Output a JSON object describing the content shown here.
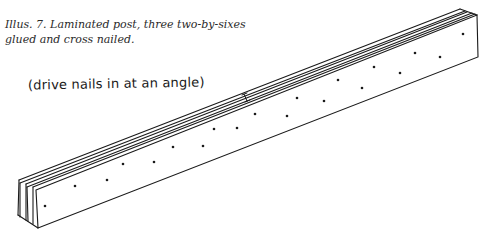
{
  "figure": {
    "caption_line1": "Illus. 7.  Laminated post, three two-by-sixes",
    "caption_line2": "glued and cross nailed.",
    "annotation": "(drive nails in at an angle)",
    "ink_color": "#1a1a1a"
  },
  "post": {
    "boards": 3,
    "nail_dots": [
      [
        45,
        206
      ],
      [
        75,
        186
      ],
      [
        107,
        180
      ],
      [
        123,
        164
      ],
      [
        154,
        162
      ],
      [
        173,
        147
      ],
      [
        203,
        146
      ],
      [
        214,
        129
      ],
      [
        237,
        128
      ],
      [
        255,
        114
      ],
      [
        287,
        116
      ],
      [
        297,
        98
      ],
      [
        324,
        101
      ],
      [
        338,
        80
      ],
      [
        362,
        88
      ],
      [
        374,
        67
      ],
      [
        400,
        73
      ],
      [
        415,
        53
      ],
      [
        440,
        57
      ],
      [
        463,
        34
      ]
    ]
  }
}
